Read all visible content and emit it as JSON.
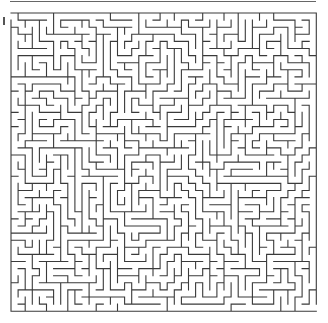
{
  "maze": {
    "cols": 43,
    "rows": 42,
    "cell_size": 7.1,
    "origin_x": 11,
    "origin_y": 13,
    "seed": 7,
    "stroke_color": "#3a3a3a",
    "background": "#ffffff",
    "entrance": {
      "side": "left",
      "row": 0
    },
    "exit": {
      "side": "right",
      "row": 41
    }
  },
  "decor": {
    "top_rule_color": "#666666"
  }
}
